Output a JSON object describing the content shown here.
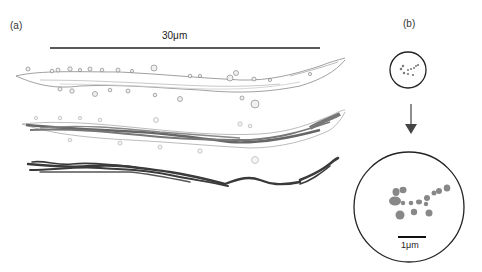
{
  "figure": {
    "panel_a": {
      "label": "(a)",
      "scale_bar_label": "30μm",
      "renderings": [
        {
          "name": "dendrite-surface",
          "style": "light gray outline with spines"
        },
        {
          "name": "dendrite-surface-with-mitochondria",
          "style": "light outline with mid-gray inner strands"
        },
        {
          "name": "mitochondria-only",
          "style": "dark gray strands"
        }
      ]
    },
    "panel_b": {
      "label": "(b)",
      "small_view": "cross-section overview circle",
      "arrow": "down-arrow",
      "scale_bar_label": "1μm",
      "cross_section_fill": "#888888"
    },
    "colors": {
      "background": "#ffffff",
      "outline": "#222222",
      "light_surface": "#c8c8c8",
      "mid_strands": "#7a7a7a",
      "dark_strands": "#3a3a3a",
      "dots": "#8a8a8a"
    }
  }
}
